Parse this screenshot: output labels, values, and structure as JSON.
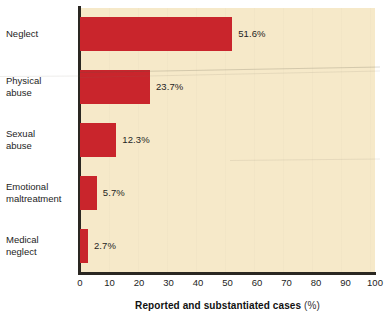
{
  "chart_data": {
    "type": "bar",
    "orientation": "horizontal",
    "title": "",
    "subtitle": "",
    "xlabel": "Reported and substantiated cases (%)",
    "xlabel_main": "Reported and substantiated cases",
    "xlabel_unit": "(%)",
    "ylabel": "",
    "categories": [
      "Neglect",
      "Physical\nabuse",
      "Sexual\nabuse",
      "Emotional\nmaltreatment",
      "Medical\nneglect"
    ],
    "values": [
      51.6,
      23.7,
      12.3,
      5.7,
      2.7
    ],
    "value_labels": [
      "51.6%",
      "23.7%",
      "12.3%",
      "5.7%",
      "2.7%"
    ],
    "xlim": [
      0,
      100
    ],
    "xticks": [
      0,
      10,
      20,
      30,
      40,
      50,
      60,
      70,
      80,
      90,
      100
    ],
    "xtick_labels": [
      "0",
      "10",
      "20",
      "30",
      "40",
      "50",
      "60",
      "70",
      "80",
      "90",
      "100"
    ],
    "grid": false,
    "legend": "none",
    "bar_color": "#c9252c",
    "plot_background": "#f6e9c9",
    "page_background": "#ffffff",
    "axis_color": "#2a2722"
  }
}
